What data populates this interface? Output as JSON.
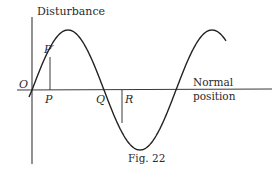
{
  "figure": {
    "caption": "Fig. 22",
    "y_axis_label": "Disturbance",
    "x_axis_label_line1": "Normal",
    "x_axis_label_line2": "position",
    "points": {
      "origin": "O",
      "p_prime": "P′",
      "p": "P",
      "q": "Q",
      "r": "R"
    },
    "curve": {
      "type": "sine-wave",
      "cycles_shown": 1.35,
      "starts_at": "origin, rising"
    }
  }
}
